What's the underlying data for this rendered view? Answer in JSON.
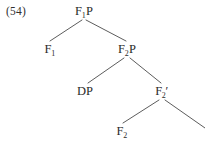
{
  "figure": {
    "example_number": "(54)",
    "type": "syntax-tree",
    "background_color": "#ffffff",
    "line_color": "#4a4a4a",
    "text_color": "#2b2b2b"
  },
  "tree": {
    "nodes": [
      {
        "id": "root",
        "label": "F1P",
        "base": "F",
        "subscript": "1",
        "prime": "",
        "suffix": "P",
        "x": 84,
        "y": 5
      },
      {
        "id": "f1",
        "label": "F1",
        "base": "F",
        "subscript": "1",
        "prime": "",
        "suffix": "",
        "x": 50,
        "y": 43
      },
      {
        "id": "f2p",
        "label": "F2P",
        "base": "F",
        "subscript": "2",
        "prime": "",
        "suffix": "P",
        "x": 127,
        "y": 43
      },
      {
        "id": "dp",
        "label": "DP",
        "base": "DP",
        "subscript": "",
        "prime": "",
        "suffix": "",
        "x": 85,
        "y": 85
      },
      {
        "id": "f2bar",
        "label": "F2'",
        "base": "F",
        "subscript": "2",
        "prime": "′",
        "suffix": "",
        "x": 162,
        "y": 85
      },
      {
        "id": "f2term",
        "label": "F2",
        "base": "F",
        "subscript": "2",
        "prime": "",
        "suffix": "",
        "x": 122,
        "y": 125
      }
    ],
    "branches": [
      {
        "id": "root-to-f1",
        "from": "root",
        "to": "f1",
        "x1": 82,
        "y1": 20,
        "x2": 50,
        "y2": 41
      },
      {
        "id": "root-to-f2p",
        "from": "root",
        "to": "f2p",
        "x1": 86,
        "y1": 20,
        "x2": 126,
        "y2": 41
      },
      {
        "id": "f2p-to-dp",
        "from": "f2p",
        "to": "dp",
        "x1": 124,
        "y1": 58,
        "x2": 88,
        "y2": 83
      },
      {
        "id": "f2p-to-f2bar",
        "from": "f2p",
        "to": "f2bar",
        "x1": 130,
        "y1": 58,
        "x2": 161,
        "y2": 83
      },
      {
        "id": "f2bar-to-f2term",
        "from": "f2bar",
        "to": "f2term",
        "x1": 159,
        "y1": 100,
        "x2": 123,
        "y2": 123
      },
      {
        "id": "f2bar-to-open",
        "from": "f2bar",
        "to": "",
        "x1": 165,
        "y1": 100,
        "x2": 205,
        "y2": 128
      }
    ]
  }
}
